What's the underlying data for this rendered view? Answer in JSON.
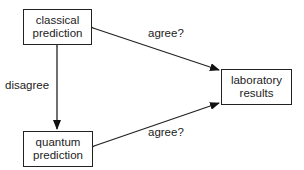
{
  "nodes": {
    "classical": {
      "line1": "classical",
      "line2": "prediction"
    },
    "quantum": {
      "line1": "quantum",
      "line2": "prediction"
    },
    "laboratory": {
      "line1": "laboratory",
      "line2": "results"
    }
  },
  "edges": {
    "classical_quantum": {
      "label": "disagree"
    },
    "classical_lab": {
      "label": "agree?"
    },
    "quantum_lab": {
      "label": "agree?"
    }
  }
}
